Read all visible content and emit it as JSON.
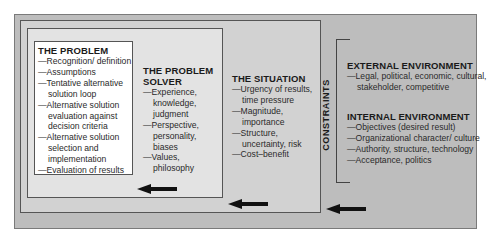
{
  "problem": {
    "title": "THE PROBLEM",
    "items": [
      "Recognition/ definition",
      "Assumptions",
      "Tentative alternative solution loop",
      "Alternative solution evaluation against decision criteria",
      "Alternative solution selection and implementation",
      "Evaluation of results"
    ]
  },
  "problem_solver": {
    "title": "THE PROBLEM SOLVER",
    "items": [
      "Experience, knowledge, judgment",
      "Perspective, personality, biases",
      "Values, philosophy"
    ]
  },
  "situation": {
    "title": "THE SITUATION",
    "items": [
      "Urgency of results, time pressure",
      "Magnitude, importance",
      "Structure, uncertainty, risk",
      "Cost–benefit"
    ]
  },
  "constraints": {
    "label": "CONSTRAINTS",
    "external": {
      "title": "EXTERNAL ENVIRONMENT",
      "items": [
        "Legal, political, economic, cultural, stakeholder, competitive"
      ]
    },
    "internal": {
      "title": "INTERNAL ENVIRONMENT",
      "items": [
        "Objectives (desired result)",
        "Organizational character/ culture",
        "Authority, structure, technology",
        "Acceptance, politics"
      ]
    }
  },
  "arrows": [
    "left-arrow",
    "left-arrow",
    "left-arrow"
  ]
}
